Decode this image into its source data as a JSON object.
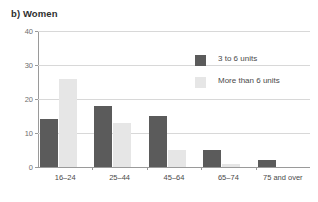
{
  "chart_data": {
    "type": "bar",
    "title": "b) Women",
    "xlabel": "",
    "ylabel": "",
    "ylim": [
      0,
      40
    ],
    "yticks": [
      0,
      10,
      20,
      30,
      40
    ],
    "grid": true,
    "legend_position": "upper-right-inside",
    "categories": [
      "16–24",
      "25–44",
      "45–64",
      "65–74",
      "75 and over"
    ],
    "series": [
      {
        "name": "3 to 6 units",
        "color": "#5b5b5b",
        "values": [
          14,
          18,
          15,
          5,
          2
        ]
      },
      {
        "name": "More than 6 units",
        "color": "#e6e6e6",
        "values": [
          26,
          13,
          5,
          1,
          0
        ]
      }
    ]
  }
}
